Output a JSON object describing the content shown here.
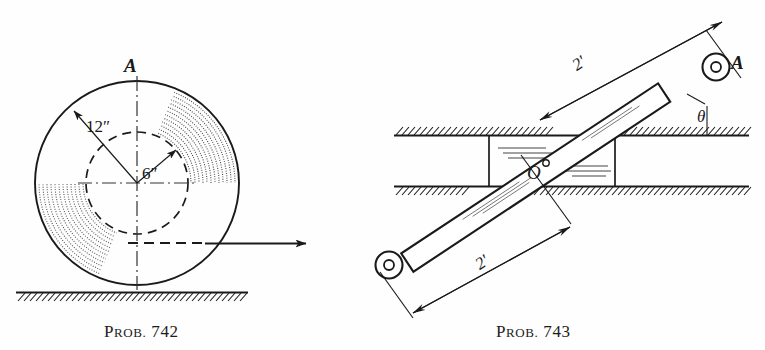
{
  "plate": {
    "background_color": "#fefefe",
    "ink_color": "#1a1a1a",
    "width": 765,
    "height": 350
  },
  "figures": [
    {
      "id": "prob-742",
      "caption": "PROB. 742",
      "caption_first_letter": "P",
      "caption_small_caps": "ROB.",
      "caption_number": "742",
      "description": "Wheel of 12 inch outer radius with 6 inch inner hub rolling on horizontal ground; point A at top, horizontal force arrow at hub level",
      "labels": [
        {
          "name": "point-A",
          "text": "A"
        },
        {
          "name": "outer-radius",
          "value": "12",
          "unit": "″",
          "text": "12″"
        },
        {
          "name": "inner-radius",
          "value": "6",
          "unit": "″",
          "text": "6″"
        }
      ],
      "geometry": {
        "center_x": 137,
        "center_y": 183,
        "outer_radius": 102,
        "inner_radius": 51,
        "ground_y": 292
      }
    },
    {
      "id": "prob-743",
      "caption": "PROB. 743",
      "caption_first_letter": "P",
      "caption_small_caps": "ROB.",
      "caption_number": "743",
      "description": "Rod pinned at O in a horizontal slot, inclined at angle theta, with 2 foot segments on each side of O, end A at upper right",
      "labels": [
        {
          "name": "point-A",
          "text": "A"
        },
        {
          "name": "pivot-O",
          "text": "O"
        },
        {
          "name": "angle-theta",
          "text": "θ"
        },
        {
          "name": "upper-length",
          "value": "2",
          "unit": "'",
          "text": "2'"
        },
        {
          "name": "lower-length",
          "value": "2",
          "unit": "'",
          "text": "2'"
        }
      ],
      "geometry": {
        "pivot_x": 536,
        "pivot_y": 178,
        "rod_angle_deg": -33,
        "slot_top_y": 135,
        "slot_bottom_y": 186
      }
    }
  ]
}
